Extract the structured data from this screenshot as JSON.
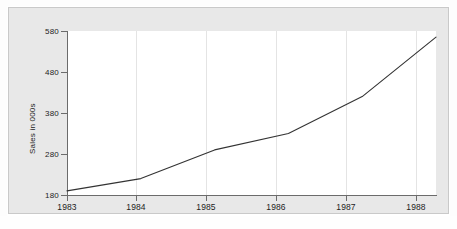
{
  "chart_data": {
    "type": "line",
    "title": "",
    "xlabel": "",
    "ylabel": "Sales in 000s",
    "categories": [
      "1983",
      "1984",
      "1985",
      "1986",
      "1987",
      "1988"
    ],
    "x": [
      1983,
      1984,
      1985,
      1986,
      1987,
      1988
    ],
    "values": [
      190,
      220,
      290,
      330,
      420,
      565
    ],
    "series": [
      {
        "name": "Sales",
        "values": [
          190,
          220,
          290,
          330,
          420,
          565
        ],
        "color": "#333333"
      }
    ],
    "xlim": [
      1983,
      1988
    ],
    "ylim": [
      180,
      580
    ],
    "yticks": [
      180,
      280,
      380,
      480,
      580
    ],
    "ytick_labels": [
      "180",
      "280",
      "380",
      "480",
      "580"
    ],
    "xticks": [
      1983,
      1984,
      1985,
      1986,
      1987,
      1988
    ],
    "xtick_labels": [
      "1983",
      "1984",
      "1985",
      "1986",
      "1987",
      "1988"
    ],
    "grid": {
      "vertical": true,
      "horizontal": false,
      "color": "#e4e4e4"
    },
    "legend": {
      "visible": false,
      "position": "none",
      "entries": []
    },
    "annotations": [],
    "style": {
      "plot_background": "#ffffff",
      "frame_background": "#e8e8e8",
      "frame_border": "#c9c9c9",
      "axis_color": "#6b6b6b",
      "text_color": "#1d1d1d",
      "line_color": "#333333",
      "line_width": 1.1
    }
  }
}
